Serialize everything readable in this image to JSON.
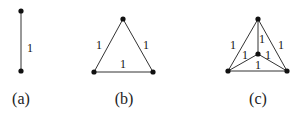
{
  "diagrams": [
    {
      "caption": "(a)",
      "nodes": [
        [
          21,
          11
        ],
        [
          21,
          71
        ]
      ],
      "edges": [
        {
          "from": 0,
          "to": 1,
          "weight": "1",
          "label_pos": [
            30,
            52
          ]
        }
      ]
    },
    {
      "caption": "(b)",
      "nodes": [
        [
          123,
          19
        ],
        [
          94,
          72
        ],
        [
          153,
          72
        ]
      ],
      "edges": [
        {
          "from": 0,
          "to": 1,
          "weight": "1",
          "label_pos": [
            99,
            49
          ]
        },
        {
          "from": 0,
          "to": 2,
          "weight": "1",
          "label_pos": [
            146,
            49
          ]
        },
        {
          "from": 1,
          "to": 2,
          "weight": "1",
          "label_pos": [
            123,
            68
          ]
        }
      ]
    },
    {
      "caption": "(c)",
      "nodes": [
        [
          258,
          19
        ],
        [
          258,
          54
        ],
        [
          228,
          71
        ],
        [
          287,
          71
        ]
      ],
      "edges": [
        {
          "from": 0,
          "to": 2,
          "weight": "1",
          "label_pos": [
            233,
            49
          ]
        },
        {
          "from": 0,
          "to": 3,
          "weight": "1",
          "label_pos": [
            281,
            49
          ]
        },
        {
          "from": 0,
          "to": 1,
          "weight": "1",
          "label_pos": [
            262,
            43
          ]
        },
        {
          "from": 1,
          "to": 2,
          "weight": "1",
          "label_pos": [
            245,
            59
          ]
        },
        {
          "from": 1,
          "to": 3,
          "weight": "1",
          "label_pos": [
            268,
            59
          ]
        },
        {
          "from": 2,
          "to": 3,
          "weight": "1",
          "label_pos": [
            258,
            69
          ]
        }
      ]
    }
  ],
  "captions": {
    "a": "(a)",
    "b": "(b)",
    "c": "(c)"
  },
  "caption_positions": {
    "a": [
      21,
      104
    ],
    "b": [
      124,
      104
    ],
    "c": [
      258,
      104
    ]
  },
  "colors": {
    "edge": "#333333",
    "node": "#111111",
    "text": "#111111"
  }
}
